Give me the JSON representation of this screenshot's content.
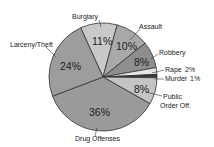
{
  "chart_data": {
    "type": "pie",
    "title": "",
    "categories": [
      "Burglary",
      "Assault",
      "Robbery",
      "Rape",
      "Murder",
      "Public Order Off.",
      "Drug Offenses",
      "Larceny/Theft"
    ],
    "values": [
      11,
      10,
      8,
      2,
      1,
      8,
      36,
      24
    ],
    "unit": "%",
    "colors": [
      "#c9c9c9",
      "#a9a9a9",
      "#8e8e8e",
      "#e6e6e6",
      "#3a3a3a",
      "#c4c4c4",
      "#9a9a9a",
      "#9d9d9d"
    ],
    "legend": "none (callout labels)"
  },
  "labels": {
    "burglary": "Burglary",
    "assault": "Assault",
    "robbery": "Robbery",
    "rape": "Rape",
    "rape_pct": "2%",
    "murder": "Murder",
    "murder_pct": "1%",
    "public1": "Public",
    "public2": "Order Off.",
    "drug": "Drug Offenses",
    "larceny": "Larceny/Theft"
  },
  "pcts": {
    "burglary": "11%",
    "assault": "10%",
    "robbery": "8%",
    "public": "8%",
    "drug": "36%",
    "larceny": "24%"
  }
}
